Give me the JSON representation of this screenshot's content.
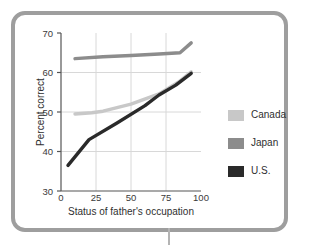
{
  "figure": {
    "frame_color": "#9e9e9e",
    "background": "#ffffff"
  },
  "legend": {
    "position": "right",
    "entries": [
      {
        "label": "Canada",
        "color": "#c8c8c8"
      },
      {
        "label": "Japan",
        "color": "#8c8c8c"
      },
      {
        "label": "U.S.",
        "color": "#2a2a2a"
      }
    ]
  },
  "axes": {
    "x_title": "Status of father's occupation",
    "y_title": "Percent correct",
    "x_ticks": [
      "0",
      "25",
      "50",
      "75",
      "100"
    ],
    "y_ticks": [
      "30",
      "40",
      "50",
      "60",
      "70"
    ]
  },
  "chart_data": {
    "type": "line",
    "title": "",
    "xlabel": "Status of father's occupation",
    "ylabel": "Percent correct",
    "xlim": [
      0,
      100
    ],
    "ylim": [
      30,
      70
    ],
    "xticks": [
      0,
      25,
      50,
      75,
      100
    ],
    "yticks": [
      30,
      40,
      50,
      60,
      70
    ],
    "grid": "both-interior",
    "gridlines_x": [
      25,
      50,
      75
    ],
    "gridlines_y": [
      40,
      50,
      60
    ],
    "legend_position": "right",
    "series": [
      {
        "name": "Canada",
        "color": "#c8c8c8",
        "x": [
          10,
          22,
          30,
          50,
          70,
          84,
          93
        ],
        "y": [
          49.5,
          49.8,
          50.2,
          52.0,
          54.6,
          57.6,
          60.2
        ]
      },
      {
        "name": "Japan",
        "color": "#8c8c8c",
        "x": [
          10,
          30,
          50,
          70,
          85,
          93
        ],
        "y": [
          63.5,
          64.0,
          64.3,
          64.7,
          65.0,
          67.5
        ]
      },
      {
        "name": "U.S.",
        "color": "#2a2a2a",
        "x": [
          5,
          20,
          40,
          60,
          70,
          82,
          93
        ],
        "y": [
          36.5,
          43.0,
          47.2,
          51.6,
          54.3,
          56.8,
          59.8
        ]
      }
    ]
  }
}
